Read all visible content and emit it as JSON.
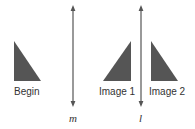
{
  "figure": {
    "shapes": [
      {
        "name": "Begin",
        "label": "Begin"
      },
      {
        "name": "Image 1",
        "label": "Image 1"
      },
      {
        "name": "Image 2",
        "label": "Image 2"
      }
    ],
    "lines": [
      {
        "name": "m",
        "label": "m"
      },
      {
        "name": "l",
        "label": "l"
      }
    ],
    "colors": {
      "triangle": "#555555",
      "line": "#555555",
      "text": "#333333"
    }
  }
}
